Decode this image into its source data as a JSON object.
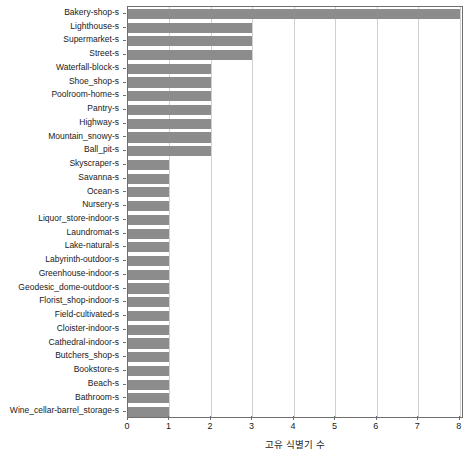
{
  "chart_data": {
    "type": "bar",
    "orientation": "horizontal",
    "title": "",
    "xlabel": "고유 식별기 수",
    "ylabel": "",
    "xlim": [
      0,
      8.1
    ],
    "xticks": [
      0,
      1,
      2,
      3,
      4,
      5,
      6,
      7,
      8
    ],
    "grid": true,
    "grid_axis": "x",
    "legend": null,
    "bar_color": "#8c8c8c",
    "axis_color": "#6e6e6e",
    "grid_color": "#d0d0d0",
    "categories": [
      "Bakery-shop-s",
      "Lighthouse-s",
      "Supermarket-s",
      "Street-s",
      "Waterfall-block-s",
      "Shoe_shop-s",
      "Poolroom-home-s",
      "Pantry-s",
      "Highway-s",
      "Mountain_snowy-s",
      "Ball_pit-s",
      "Skyscraper-s",
      "Savanna-s",
      "Ocean-s",
      "Nursery-s",
      "Liquor_store-indoor-s",
      "Laundromat-s",
      "Lake-natural-s",
      "Labyrinth-outdoor-s",
      "Greenhouse-indoor-s",
      "Geodesic_dome-outdoor-s",
      "Florist_shop-indoor-s",
      "Field-cultivated-s",
      "Cloister-indoor-s",
      "Cathedral-indoor-s",
      "Butchers_shop-s",
      "Bookstore-s",
      "Beach-s",
      "Bathroom-s",
      "Wine_cellar-barrel_storage-s"
    ],
    "values": [
      8,
      3,
      3,
      3,
      2,
      2,
      2,
      2,
      2,
      2,
      2,
      1,
      1,
      1,
      1,
      1,
      1,
      1,
      1,
      1,
      1,
      1,
      1,
      1,
      1,
      1,
      1,
      1,
      1,
      1
    ]
  }
}
